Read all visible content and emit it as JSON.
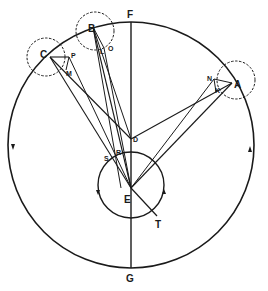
{
  "diagram": {
    "colors": {
      "line": "#1a1a1a",
      "background": "#ffffff"
    },
    "labels": {
      "F": "F",
      "G": "G",
      "E": "E",
      "T": "T",
      "D": "D",
      "A": "A",
      "B": "B",
      "C": "C",
      "N": "N",
      "K": "K",
      "O": "O",
      "L": "L",
      "P": "P",
      "M": "M",
      "S": "S",
      "R": "R"
    },
    "circles": [
      {
        "name": "deferent",
        "cx": 131,
        "cy": 145,
        "r": 123,
        "style": "solid"
      },
      {
        "name": "inner-circle",
        "cx": 131,
        "cy": 185,
        "r": 33,
        "style": "solid"
      },
      {
        "name": "epicycle-A",
        "cx": 236,
        "cy": 80,
        "r": 19,
        "style": "dashed"
      },
      {
        "name": "epicycle-B",
        "cx": 95,
        "cy": 31,
        "r": 19,
        "style": "dashed"
      },
      {
        "name": "epicycle-C",
        "cx": 46,
        "cy": 57,
        "r": 19,
        "style": "dashed"
      }
    ],
    "points": {
      "F": [
        131,
        22
      ],
      "G": [
        131,
        268
      ],
      "E": [
        131,
        188
      ],
      "D": [
        131,
        139
      ],
      "T": [
        157,
        217
      ],
      "A": [
        232,
        83
      ],
      "B": [
        93,
        27
      ],
      "C": [
        50,
        57
      ]
    }
  }
}
